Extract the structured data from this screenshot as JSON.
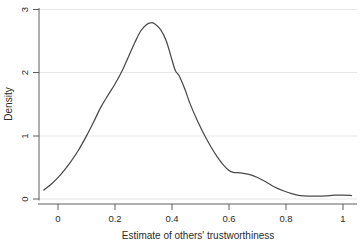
{
  "chart_data": {
    "type": "line",
    "title": "",
    "subtitle": "",
    "xlabel": "Estimate of others' trustworthiness",
    "ylabel": "Density",
    "xlim": [
      -0.05,
      1.05
    ],
    "ylim": [
      0,
      3.05
    ],
    "xticks": [
      0,
      0.2,
      0.4,
      0.6,
      0.8,
      1
    ],
    "xticklabels": [
      "0",
      "0.2",
      "0.4",
      "0.6",
      "0.8",
      "1"
    ],
    "yticks": [
      0,
      1,
      2,
      3
    ],
    "yticklabels": [
      "0",
      "1",
      "2",
      "3"
    ],
    "grid": "horizontal",
    "legend": "none",
    "line_color": "#4a4a4a",
    "series": [
      {
        "name": "Kernel density of estimate of others' trustworthiness",
        "x": [
          -0.05,
          -0.02,
          0.01,
          0.04,
          0.07,
          0.1,
          0.125,
          0.15,
          0.175,
          0.2,
          0.225,
          0.25,
          0.27,
          0.29,
          0.31,
          0.325,
          0.34,
          0.36,
          0.38,
          0.4,
          0.412,
          0.425,
          0.445,
          0.465,
          0.49,
          0.515,
          0.54,
          0.56,
          0.58,
          0.6,
          0.615,
          0.64,
          0.67,
          0.7,
          0.73,
          0.76,
          0.79,
          0.82,
          0.85,
          0.88,
          0.91,
          0.94,
          0.97,
          1.0,
          1.03
        ],
        "y": [
          0.14,
          0.25,
          0.39,
          0.56,
          0.76,
          1.0,
          1.22,
          1.45,
          1.64,
          1.82,
          2.03,
          2.28,
          2.48,
          2.66,
          2.76,
          2.79,
          2.77,
          2.68,
          2.5,
          2.2,
          2.03,
          1.95,
          1.74,
          1.49,
          1.23,
          1.0,
          0.8,
          0.66,
          0.54,
          0.45,
          0.42,
          0.415,
          0.39,
          0.34,
          0.27,
          0.19,
          0.13,
          0.085,
          0.055,
          0.045,
          0.045,
          0.05,
          0.06,
          0.06,
          0.055
        ]
      }
    ],
    "annotations": {
      "peak_x": 0.325,
      "peak_y": 2.79
    }
  },
  "axes": {
    "x_title": "Estimate of others' trustworthiness",
    "y_title": "Density"
  },
  "ticks": {
    "x": [
      "0",
      "0.2",
      "0.4",
      "0.6",
      "0.8",
      "1"
    ],
    "y": [
      "0",
      "1",
      "2",
      "3"
    ]
  }
}
